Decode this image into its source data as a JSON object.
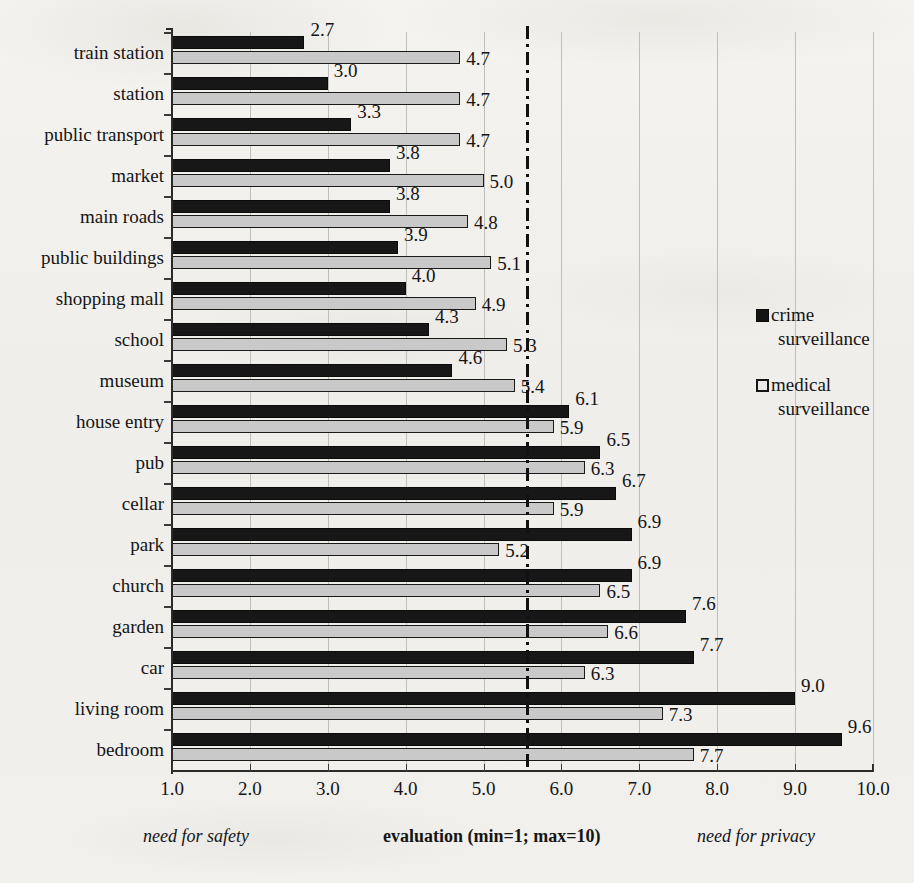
{
  "chart_data": {
    "type": "bar",
    "orientation": "horizontal",
    "title": "",
    "xlabel": "evaluation (min=1; max=10)",
    "ylabel": "",
    "xlim": [
      1.0,
      10.0
    ],
    "xticks": [
      "1.0",
      "2.0",
      "3.0",
      "4.0",
      "5.0",
      "6.0",
      "7.0",
      "8.0",
      "9.0",
      "10.0"
    ],
    "grid": "vertical",
    "legend_position": "right",
    "threshold_line": 5.5,
    "categories": [
      "train station",
      "station",
      "public transport",
      "market",
      "main roads",
      "public buildings",
      "shopping mall",
      "school",
      "museum",
      "house entry",
      "pub",
      "cellar",
      "park",
      "church",
      "garden",
      "car",
      "living room",
      "bedroom"
    ],
    "series": [
      {
        "name": "crime surveillance",
        "color": "#171717",
        "values": [
          2.7,
          3.0,
          3.3,
          3.8,
          3.8,
          3.9,
          4.0,
          4.3,
          4.6,
          6.1,
          6.5,
          6.7,
          6.9,
          6.9,
          7.6,
          7.7,
          9.0,
          9.6
        ],
        "labels": [
          "2.7",
          "3.0",
          "3.3",
          "3.8",
          "3.8",
          "3.9",
          "4.0",
          "4.3",
          "4.6",
          "6.1",
          "6.5",
          "6.7",
          "6.9",
          "6.9",
          "7.6",
          "7.7",
          "9.0",
          "9.6"
        ]
      },
      {
        "name": "medical surveillance",
        "color": "#c9c9c9",
        "values": [
          4.7,
          4.7,
          4.7,
          5.0,
          4.8,
          5.1,
          4.9,
          5.3,
          5.4,
          5.9,
          6.3,
          5.9,
          5.2,
          6.5,
          6.6,
          6.3,
          7.3,
          7.7
        ],
        "labels": [
          "4.7",
          "4.7",
          "4.7",
          "5.0",
          "4.8",
          "5.1",
          "4.9",
          "5.3",
          "5.4",
          "5.9",
          "6.3",
          "5.9",
          "5.2",
          "6.5",
          "6.6",
          "6.3",
          "7.3",
          "7.7"
        ]
      }
    ],
    "annotations": {
      "left": "need for safety",
      "center": "evaluation (min=1; max=10)",
      "right": "need for privacy"
    }
  },
  "legend": {
    "entries": [
      {
        "marker": "filled-square-icon",
        "line1": "crime",
        "line2": "surveillance"
      },
      {
        "marker": "open-square-icon",
        "line1": "medical",
        "line2": "surveillance"
      }
    ]
  },
  "colors": {
    "background": "#f2f1ed",
    "crime_fill": "#171717",
    "medical_fill": "#c9c9c9",
    "axis": "#2a2a2a",
    "gridline": "#bfbfba",
    "text": "#151515"
  }
}
